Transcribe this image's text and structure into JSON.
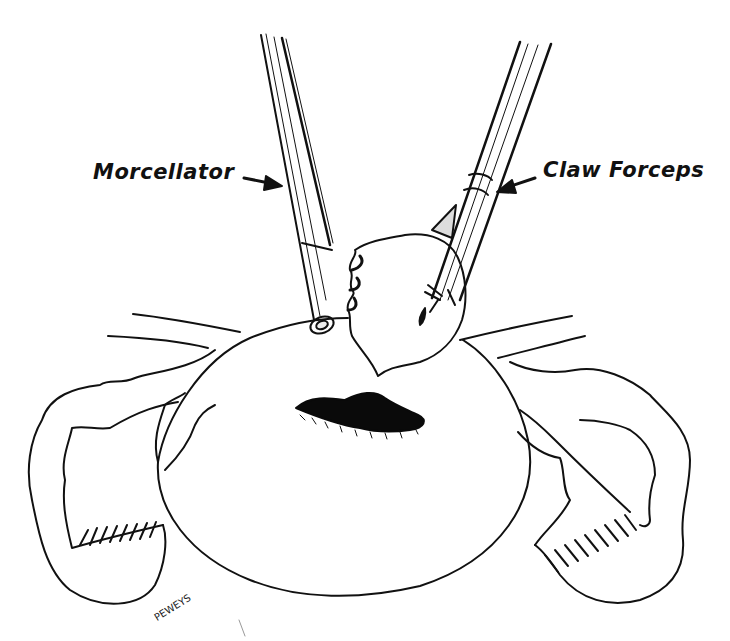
{
  "figure": {
    "type": "medical line illustration",
    "colors": {
      "ink": "#111111",
      "background": "#ffffff",
      "fill": "#0a0a0a"
    }
  },
  "labels": {
    "morcellator": "Morcellator",
    "claw_forceps": "Claw Forceps"
  },
  "signature": "PEWEYS"
}
